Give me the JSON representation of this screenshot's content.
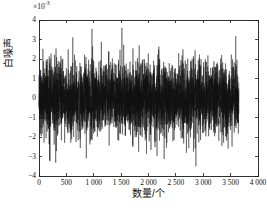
{
  "chart_data": {
    "type": "line",
    "title": "",
    "subtitle": "",
    "xlabel": "数量/个",
    "ylabel": "白噪声",
    "y_multiplier_text": "×10",
    "y_multiplier_exponent": "-3",
    "y_multiplier_value": 0.001,
    "xlim": [
      0,
      4000
    ],
    "ylim": [
      -4,
      4
    ],
    "xticks": [
      0,
      500,
      1000,
      1500,
      2000,
      2500,
      3000,
      3500,
      4000
    ],
    "xtick_labels": [
      "0",
      "500",
      "1 000",
      "1 500",
      "2 000",
      "2 500",
      "3 000",
      "3 500",
      "4 000"
    ],
    "yticks": [
      -4,
      -3,
      -2,
      -1,
      0,
      1,
      2,
      3,
      4
    ],
    "ytick_labels": [
      "-4",
      "-3",
      "-2",
      "-1",
      "0",
      "1",
      "2",
      "3",
      "4"
    ],
    "grid": false,
    "legend": null,
    "tick_direction": "in",
    "box": true,
    "series": [
      {
        "name": "白噪声",
        "color": "#111111",
        "line_width": 0.42,
        "n_points": 3650,
        "x_start": 0,
        "x_end": 3650,
        "distribution": "gaussian",
        "mean": 0.0,
        "std_dev": 0.92,
        "min_observed": -3.5,
        "max_observed": 3.6,
        "units": "×10^-3"
      }
    ],
    "annotations": []
  },
  "figure": {
    "background_color": "#ffffff",
    "axis_color": "#1a1a1a",
    "plot_left_px": 39,
    "plot_top_px": 20,
    "plot_right_px": 258,
    "plot_bottom_px": 176
  }
}
